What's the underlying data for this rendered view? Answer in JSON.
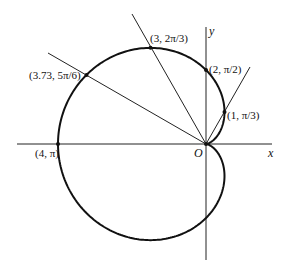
{
  "figure": {
    "type": "polar-curve",
    "curve": "r = 2 - 2cos(theta)",
    "curve_color": "#111111",
    "axes": {
      "x_label": "x",
      "y_label": "y",
      "origin_label": "O"
    },
    "points": [
      {
        "label": "(1, π/3)",
        "r": 1,
        "theta_deg": 60
      },
      {
        "label": "(2, π/2)",
        "r": 2,
        "theta_deg": 90
      },
      {
        "label": "(3, 2π/3)",
        "r": 3,
        "theta_deg": 120
      },
      {
        "label": "(3.73, 5π/6)",
        "r": 3.73,
        "theta_deg": 150
      },
      {
        "label": "(4, π)",
        "r": 4,
        "theta_deg": 180
      }
    ],
    "rays_deg": [
      60,
      120,
      150
    ]
  }
}
